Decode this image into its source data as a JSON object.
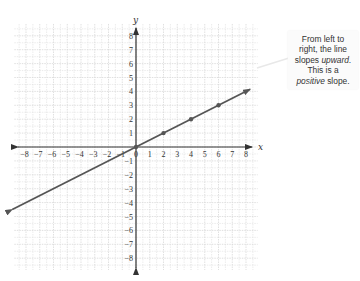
{
  "chart_data": {
    "type": "line",
    "title": "",
    "xlabel": "x",
    "ylabel": "y",
    "xlim": [
      -8,
      8
    ],
    "ylim": [
      -8,
      8
    ],
    "grid": true,
    "x_ticks": [
      -8,
      -7,
      -6,
      -5,
      -4,
      -3,
      -2,
      -1,
      0,
      1,
      2,
      3,
      4,
      5,
      6,
      7,
      8
    ],
    "y_ticks": [
      -8,
      -7,
      -6,
      -5,
      -4,
      -3,
      -2,
      -1,
      1,
      2,
      3,
      4,
      5,
      6,
      7,
      8
    ],
    "series": [
      {
        "name": "line",
        "equation": "y = 0.5x",
        "slope": 0.5,
        "intercept": 0,
        "points": [
          [
            0,
            0
          ],
          [
            2,
            1
          ],
          [
            4,
            2
          ],
          [
            6,
            3
          ]
        ],
        "extends": [
          [
            -9,
            -4.5
          ],
          [
            8.3,
            4.15
          ]
        ],
        "color": "#555555"
      }
    ],
    "annotations": [
      {
        "text_parts": [
          "From left to right, the line slopes ",
          "upward",
          ". This is a ",
          "positive",
          " slope."
        ]
      }
    ]
  },
  "callout": {
    "line1": "From left to",
    "line2": "right, the line",
    "line3a": "slopes ",
    "line3b": "upward",
    "line3c": ".",
    "line4": "This is a",
    "line5a": "positive",
    "line5b": " slope."
  },
  "colors": {
    "axis": "#333333",
    "grid": "#d8d8d8",
    "line": "#555555",
    "text": "#333333"
  }
}
